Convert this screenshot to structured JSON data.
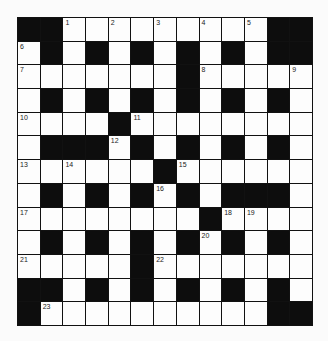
{
  "puzzle": {
    "rows": 13,
    "cols": 13,
    "layout": [
      "##.........##",
      ".#.#.#.#.#.##",
      ".......#.....",
      ".#.#.#.#.#.#.",
      "....#........",
      ".###.#.#.#.#.",
      "......#......",
      ".#.#.#.#.###.",
      "........#....",
      ".#.#.#.#.#.#.",
      ".....#.......",
      "##.#.#.#.#.#.",
      "#..........##"
    ],
    "numbers": [
      {
        "n": "1",
        "r": 0,
        "c": 2
      },
      {
        "n": "2",
        "r": 0,
        "c": 4
      },
      {
        "n": "3",
        "r": 0,
        "c": 6
      },
      {
        "n": "4",
        "r": 0,
        "c": 8
      },
      {
        "n": "5",
        "r": 0,
        "c": 10
      },
      {
        "n": "6",
        "r": 1,
        "c": 0
      },
      {
        "n": "7",
        "r": 2,
        "c": 0
      },
      {
        "n": "8",
        "r": 2,
        "c": 8
      },
      {
        "n": "9",
        "r": 2,
        "c": 12
      },
      {
        "n": "10",
        "r": 4,
        "c": 0
      },
      {
        "n": "11",
        "r": 4,
        "c": 5
      },
      {
        "n": "12",
        "r": 5,
        "c": 4
      },
      {
        "n": "13",
        "r": 6,
        "c": 0
      },
      {
        "n": "14",
        "r": 6,
        "c": 2
      },
      {
        "n": "15",
        "r": 6,
        "c": 7
      },
      {
        "n": "16",
        "r": 7,
        "c": 6
      },
      {
        "n": "17",
        "r": 8,
        "c": 0
      },
      {
        "n": "18",
        "r": 8,
        "c": 9
      },
      {
        "n": "19",
        "r": 8,
        "c": 10
      },
      {
        "n": "20",
        "r": 9,
        "c": 8
      },
      {
        "n": "21",
        "r": 10,
        "c": 0
      },
      {
        "n": "22",
        "r": 10,
        "c": 6
      },
      {
        "n": "23",
        "r": 12,
        "c": 1
      }
    ],
    "colors": {
      "black_square": "#0d0d0d",
      "white_square": "#fdfdfd",
      "grid_line": "#111111"
    }
  }
}
